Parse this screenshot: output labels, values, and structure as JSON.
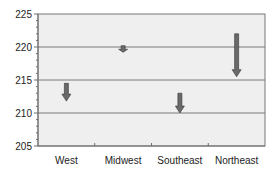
{
  "chart_data": {
    "type": "arrow",
    "title": "",
    "xlabel": "",
    "ylabel": "",
    "categories": [
      "West",
      "Midwest",
      "Southeast",
      "Northeast"
    ],
    "series": [
      {
        "name": "start",
        "values": [
          214.5,
          220.2,
          213.0,
          222.0
        ]
      },
      {
        "name": "end",
        "values": [
          211.8,
          219.2,
          210.0,
          215.5
        ]
      }
    ],
    "ylim": [
      205,
      225
    ],
    "yticks": [
      205,
      210,
      215,
      220,
      225
    ],
    "ytick_labels": [
      "205",
      "210",
      "215",
      "220",
      "225"
    ],
    "y_minor_step": 1,
    "grid": true,
    "legend": null,
    "colors": {
      "plot_bg": "#efefef",
      "grid": "#7a7a7a",
      "axis": "#6f6f6f",
      "arrow": "#6a6a6a",
      "arrow_edge": "#333333"
    }
  }
}
